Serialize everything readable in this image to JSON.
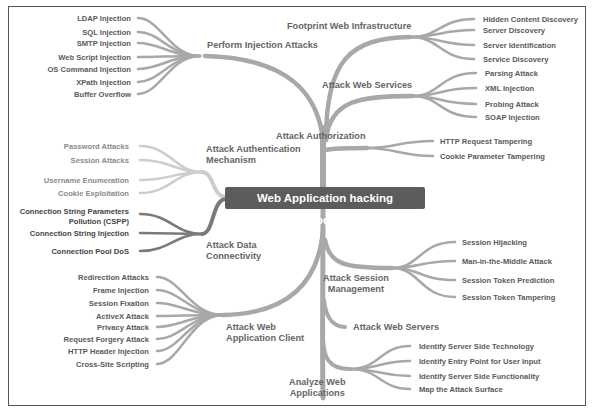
{
  "title_fragment": "...p",
  "center": {
    "label": "Web Application hacking Methodology",
    "color": "#5c5c5c"
  },
  "colors": {
    "branch_mid": "#a8a8a8",
    "branch_light": "#cdcdcd",
    "branch_dark": "#7a7a7a",
    "text": "#5a5a5a"
  },
  "branches": {
    "injection": {
      "label": "Perform Injection Attacks",
      "children": [
        "LDAP Injection",
        "SQL Injection",
        "SMTP Injection",
        "Web Script Injection",
        "OS Command Injection",
        "XPath Injection",
        "Buffer Overflow"
      ]
    },
    "footprint": {
      "label": "Footprint Web Infrastructure",
      "children": [
        "Hidden Content Discovery",
        "Server Discovery",
        "Server Identification",
        "Service Discovery"
      ]
    },
    "webservices": {
      "label": "Attack Web Services",
      "children": [
        "Parsing Attack",
        "XML Injection",
        "Probing Attack",
        "SOAP Injection"
      ]
    },
    "authorization": {
      "label": "Attack Authorization",
      "children": [
        "HTTP Request Tampering",
        "Cookie Parameter Tampering"
      ]
    },
    "authentication": {
      "label_line1": "Attack Authentication",
      "label_line2": "Mechanism",
      "children": [
        "Password Attacks",
        "Session Attacks",
        "Username Enumeration",
        "Cookie Exploitation"
      ]
    },
    "dataconn": {
      "label_line1": "Attack Data",
      "label_line2": "Connectivity",
      "children": [
        "Connection String Parameters",
        "Pollution (CSPP)",
        "Connection String Injection",
        "Connection Pool DoS"
      ]
    },
    "session": {
      "label_line1": "Attack Session",
      "label_line2": "Management",
      "children": [
        "Session Hijacking",
        "Man-in-the-Middle Attack",
        "Session Token Prediction",
        "Session Token Tampering"
      ]
    },
    "client": {
      "label_line1": "Attack Web",
      "label_line2": "Application Client",
      "children": [
        "Redirection Attacks",
        "Frame Injection",
        "Session Fixation",
        "ActiveX Attack",
        "Privacy Attack",
        "Request Forgery Attack",
        "HTTP Header Injection",
        "Cross-Site Scripting"
      ]
    },
    "webservers": {
      "label": "Attack Web Servers"
    },
    "analyze": {
      "label_line1": "Analyze Web",
      "label_line2": "Applications",
      "children": [
        "Identify Server Side Technology",
        "Identify Entry Point for User Input",
        "Identify Server Side Functionality",
        "Map the Attack Surface"
      ]
    }
  }
}
